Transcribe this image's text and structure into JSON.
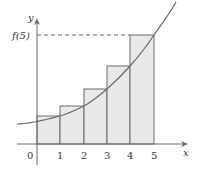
{
  "diagram": {
    "type": "right-riemann-sum",
    "axes": {
      "x_label": "x",
      "y_label": "y",
      "x_ticks": [
        "0",
        "1",
        "2",
        "3",
        "4",
        "5"
      ]
    },
    "annotation": "f(5)",
    "bars": [
      {
        "from": 0,
        "to": 1,
        "height_label": "f(1)"
      },
      {
        "from": 1,
        "to": 2,
        "height_label": "f(2)"
      },
      {
        "from": 2,
        "to": 3,
        "height_label": "f(3)"
      },
      {
        "from": 3,
        "to": 4,
        "height_label": "f(4)"
      },
      {
        "from": 4,
        "to": 5,
        "height_label": "f(5)"
      }
    ],
    "colors": {
      "axis": "#666666",
      "bar_fill": "#e8e8e8",
      "bar_stroke": "#666666",
      "curve": "#666666",
      "dash": "#666666"
    }
  }
}
